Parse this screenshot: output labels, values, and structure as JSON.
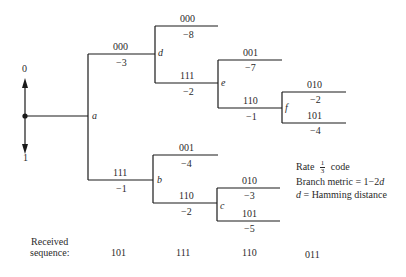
{
  "diagram": {
    "type": "tree-diagram",
    "root": {
      "up_label": "0",
      "down_label": "1"
    },
    "nodes": {
      "a": "a",
      "b": "b",
      "c": "c",
      "d": "d",
      "e": "e",
      "f": "f"
    },
    "branches": [
      {
        "id": "a-d",
        "code": "000",
        "metric": "−3"
      },
      {
        "id": "a-b",
        "code": "111",
        "metric": "−1"
      },
      {
        "id": "d-top",
        "code": "000",
        "metric": "−8"
      },
      {
        "id": "d-e",
        "code": "111",
        "metric": "−2"
      },
      {
        "id": "e-top",
        "code": "001",
        "metric": "−7"
      },
      {
        "id": "e-f",
        "code": "110",
        "metric": "−1"
      },
      {
        "id": "f-top",
        "code": "010",
        "metric": "−2"
      },
      {
        "id": "f-bottom",
        "code": "101",
        "metric": "−4"
      },
      {
        "id": "b-top",
        "code": "001",
        "metric": "−4"
      },
      {
        "id": "b-c",
        "code": "110",
        "metric": "−2"
      },
      {
        "id": "c-top",
        "code": "010",
        "metric": "−3"
      },
      {
        "id": "c-bottom",
        "code": "101",
        "metric": "−5"
      }
    ],
    "legend": {
      "rate_prefix": "Rate",
      "rate_num": "1",
      "rate_den": "3",
      "rate_suffix": "code",
      "line2_text": "Branch metric = 1−2",
      "line2_var": "d",
      "line3_var": "d",
      "line3_text": " = Hamming distance"
    },
    "received": {
      "label_line1": "Received",
      "label_line2": "sequence:",
      "symbols": [
        "101",
        "111",
        "110",
        "011"
      ]
    },
    "colors": {
      "line": "#1a1a1a",
      "text": "#2a2a2a",
      "background": "#ffffff"
    }
  }
}
